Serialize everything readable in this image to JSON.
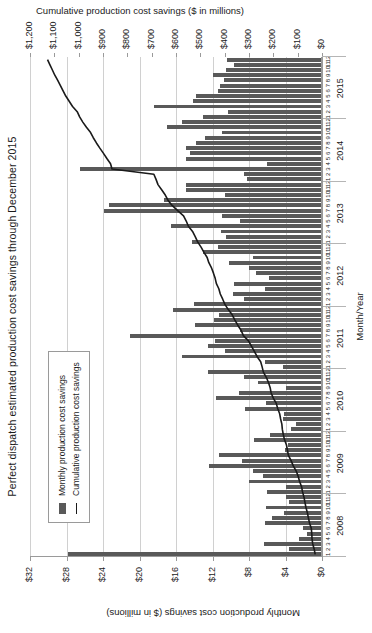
{
  "chart_data": {
    "type": "bar",
    "title": "Perfect dispatch estimated production cost savings through December 2015",
    "xlabel": "Month/Year",
    "ylabel": "Monthly production cost savings ($ in millions)",
    "y2label": "Cumulative production cost savings ($ in millions)",
    "grid": true,
    "legend_position": "upper-left-inside",
    "ylim": [
      0,
      32
    ],
    "y2lim": [
      0,
      1200
    ],
    "yticks": [
      "$0",
      "$4",
      "$8",
      "$12",
      "$16",
      "$20",
      "$24",
      "$28",
      "$32"
    ],
    "ytick_values": [
      0,
      4,
      8,
      12,
      16,
      20,
      24,
      28,
      32
    ],
    "y2ticks": [
      "$0",
      "$100",
      "$200",
      "$300",
      "$400",
      "$500",
      "$600",
      "$700",
      "$800",
      "$900",
      "$1,000",
      "$1,100",
      "$1,200"
    ],
    "y2tick_values": [
      0,
      100,
      200,
      300,
      400,
      500,
      600,
      700,
      800,
      900,
      1000,
      1100,
      1200
    ],
    "years": [
      "2008",
      "2009",
      "2010",
      "2011",
      "2012",
      "2013",
      "2014",
      "2015"
    ],
    "months": [
      1,
      2,
      3,
      4,
      5,
      6,
      7,
      8,
      9,
      10,
      11,
      12
    ],
    "bar_color": "#595959",
    "line_color": "#1a1a1a",
    "series": [
      {
        "name": "Monthly production cost savings",
        "type": "bar",
        "axis": "left",
        "values": [
          27.8,
          3.6,
          6.4,
          2.5,
          1.6,
          2.1,
          6.3,
          5.5,
          4.2,
          6.1,
          3.6,
          3.9,
          6.0,
          3.9,
          8.0,
          6.5,
          7.6,
          12.4,
          8.8,
          11.3,
          4.1,
          3.7,
          7.5,
          5.7,
          3.4,
          2.8,
          4.3,
          4.2,
          8.4,
          6.1,
          11.6,
          9.1,
          4.0,
          7.0,
          8.6,
          12.5,
          4.3,
          6.3,
          15.3,
          10.6,
          12.5,
          11.7,
          21.0,
          9.0,
          13.9,
          11.8,
          11.3,
          16.3,
          14.0,
          8.5,
          9.8,
          6.2,
          9.6,
          5.8,
          7.2,
          8.0,
          10.2,
          7.6,
          13.0,
          11.4,
          14.2,
          10.5,
          11.1,
          16.5,
          9.0,
          11.0,
          23.9,
          23.3,
          17.3,
          10.6,
          14.9,
          14.9,
          8.2,
          8.6,
          26.5,
          6.0,
          14.9,
          14.5,
          14.9,
          13.8,
          12.8,
          11.0,
          17.0,
          15.3,
          13.0,
          10.3,
          18.4,
          14.1,
          13.8,
          11.4,
          11.2,
          10.7,
          12.0,
          10.5,
          9.6,
          10.4
        ]
      },
      {
        "name": "Cumulative production cost savings",
        "type": "line",
        "axis": "right",
        "values": [
          28,
          32,
          38,
          41,
          42,
          44,
          51,
          56,
          60,
          66,
          70,
          74,
          80,
          84,
          92,
          98,
          106,
          118,
          127,
          138,
          142,
          146,
          154,
          159,
          163,
          165,
          170,
          174,
          182,
          188,
          200,
          209,
          213,
          220,
          229,
          241,
          246,
          252,
          267,
          278,
          290,
          302,
          323,
          332,
          346,
          358,
          369,
          385,
          399,
          408,
          418,
          424,
          434,
          439,
          446,
          454,
          465,
          472,
          485,
          497,
          511,
          521,
          532,
          549,
          558,
          569,
          593,
          616,
          633,
          644,
          659,
          674,
          682,
          691,
          863,
          869,
          884,
          898,
          913,
          927,
          940,
          951,
          968,
          983,
          996,
          1006,
          1025,
          1039,
          1053,
          1064,
          1075,
          1086,
          1098,
          1108,
          1118,
          1128
        ]
      }
    ]
  },
  "legend": {
    "items": [
      {
        "label": "Monthly production cost savings",
        "swatch": "bar-swatch"
      },
      {
        "label": "Cumulative production cost savings",
        "swatch": "line-swatch"
      }
    ]
  }
}
